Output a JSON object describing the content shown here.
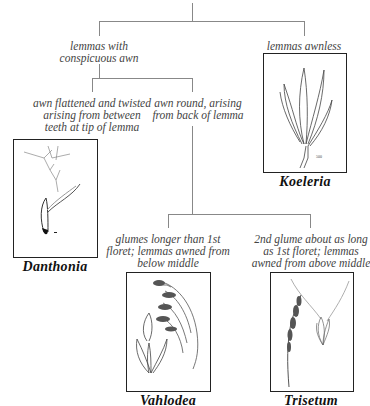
{
  "diagram": {
    "type": "dichotomous-key",
    "top_text_partial": "",
    "nodes": {
      "branch_awned": {
        "text_lines": [
          "lemmas with",
          "conspicuous awn"
        ]
      },
      "branch_awnless": {
        "text_lines": [
          "lemmas awnless"
        ]
      },
      "branch_flattened": {
        "text_lines": [
          "awn flattened and twisted",
          "arising from between",
          "teeth at tip of lemma"
        ]
      },
      "branch_round": {
        "text_lines": [
          "awn round, arising",
          "from back of lemma"
        ]
      },
      "branch_glumes_longer": {
        "text_lines": [
          "glumes longer than 1st",
          "floret; lemmas awned from",
          "below middle"
        ]
      },
      "branch_2nd_glume": {
        "text_lines": [
          "2nd glume about as long",
          "as 1st floret; lemmas",
          "awned from above middle"
        ]
      }
    },
    "genera": {
      "koeleria": {
        "name": "Koeleria",
        "illustration": "koeleria-spikelet-illustration"
      },
      "danthonia": {
        "name": "Danthonia",
        "illustration": "danthonia-floret-illustration"
      },
      "vahlodea": {
        "name": "Vahlodea",
        "illustration": "vahlodea-panicle-illustration"
      },
      "trisetum": {
        "name": "Trisetum",
        "illustration": "trisetum-panicle-illustration"
      }
    },
    "colors": {
      "line": "#888888",
      "box_border": "#222222",
      "text": "#444444",
      "label": "#111111"
    }
  }
}
